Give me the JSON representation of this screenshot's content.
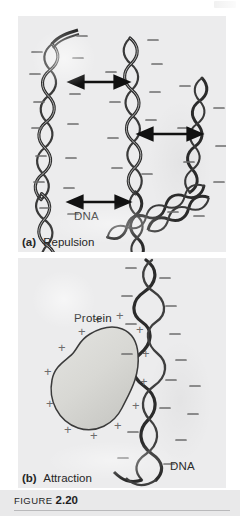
{
  "figure": {
    "number_word": "FIGURE",
    "number": "2.20",
    "panel_bg": "#ececed",
    "dna_color": "#2b2b2b",
    "protein_fill": "#d9d9d6",
    "protein_stroke": "#3a3a3a",
    "charge_color": "#6d6d6d",
    "arrow_color": "#111111"
  },
  "panel_a": {
    "caption_tag": "(a)",
    "caption_text": "Repulsion",
    "dna_label": "DNA",
    "charge_symbol": "–",
    "charge_name": "negative-charge",
    "molecule_count": 4,
    "arrows": [
      {
        "name": "repulsion-arrow-1",
        "label": "double-headed arrow between left and center DNA"
      },
      {
        "name": "repulsion-arrow-2",
        "label": "double-headed arrow between center and right DNA"
      },
      {
        "name": "repulsion-arrow-3",
        "label": "double-headed arrow between left and lower DNA"
      }
    ]
  },
  "panel_b": {
    "caption_tag": "(b)",
    "caption_text": "Attraction",
    "protein_label": "Protein",
    "dna_label": "DNA",
    "dna_charge_symbol": "–",
    "protein_charge_symbol": "+",
    "dna_charge_name": "negative-charge",
    "protein_charge_name": "positive-charge"
  }
}
